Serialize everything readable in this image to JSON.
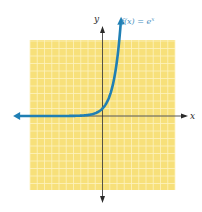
{
  "chart_data": {
    "type": "line",
    "title": "",
    "function_label": "f(x) = e",
    "function_label_exponent": "x",
    "xlabel": "x",
    "ylabel": "y",
    "xlim": [
      -10,
      10
    ],
    "ylim": [
      -10,
      10
    ],
    "grid": true,
    "grid_step": 1,
    "series": [
      {
        "name": "f(x) = e^x",
        "expression": "exp(x)",
        "x_range": [
          -11.5,
          2.52
        ],
        "arrows": "both-ends"
      }
    ]
  },
  "colors": {
    "grid_background": "#f7e07a",
    "grid_lines": "#fdf3c0",
    "curve": "#1f7fb4",
    "axes": "#2a2a2a",
    "label": "#4a8fc0"
  }
}
